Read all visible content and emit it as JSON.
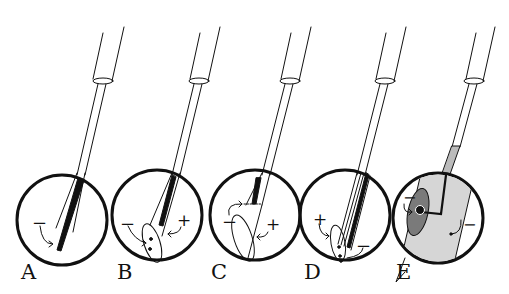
{
  "figure": {
    "panels": [
      {
        "label": "A",
        "signs": [
          "−"
        ]
      },
      {
        "label": "B",
        "signs": [
          "−",
          "+"
        ]
      },
      {
        "label": "C",
        "signs": [
          "−",
          "+"
        ]
      },
      {
        "label": "D",
        "signs": [
          "+",
          "−"
        ]
      },
      {
        "label": "E",
        "signs": [
          "−",
          "−"
        ]
      }
    ],
    "colors": {
      "ink": "#111111",
      "fill_gray": "#d8d8d8",
      "fill_dark": "#7a7a7a",
      "background": "#ffffff"
    }
  }
}
